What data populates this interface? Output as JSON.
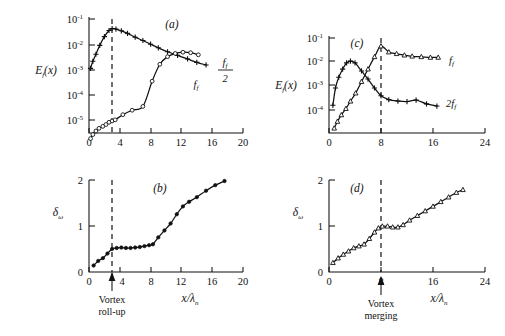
{
  "figure": {
    "panels": [
      {
        "id": "(a)",
        "ylabel": "E_f(x)",
        "y_ticks": [
          {
            "base": "10",
            "exp": "-1"
          },
          {
            "base": "10",
            "exp": "-2"
          },
          {
            "base": "10",
            "exp": "-3"
          },
          {
            "base": "10",
            "exp": "-4"
          },
          {
            "base": "10",
            "exp": "-5"
          }
        ],
        "x_ticks": [
          "0",
          "4",
          "8",
          "12",
          "16",
          "20"
        ],
        "curve_labels": [
          {
            "name": "f_f_over_2",
            "num": "f",
            "numsub": "f",
            "den": "2"
          },
          {
            "name": "f_f",
            "text": "f",
            "sub": "f"
          }
        ],
        "dashed_x": "3"
      },
      {
        "id": "(b)",
        "ylabel": "δ",
        "ylabel_sub": "ω",
        "y_ticks": [
          "0",
          "1",
          "2"
        ],
        "x_ticks": [
          "0",
          "4",
          "8",
          "12",
          "16",
          "20"
        ],
        "xlabel": "x/λ",
        "xlabel_sub": "n",
        "annotation": [
          "Vortex",
          "roll-up"
        ],
        "dashed_x": "3"
      },
      {
        "id": "(c)",
        "ylabel": "E_f(x)",
        "y_ticks": [
          {
            "base": "10",
            "exp": "-1"
          },
          {
            "base": "10",
            "exp": "-2"
          },
          {
            "base": "10",
            "exp": "-3"
          },
          {
            "base": "10",
            "exp": "-4"
          }
        ],
        "x_ticks": [
          "0",
          "8",
          "16",
          "24"
        ],
        "curve_labels": [
          {
            "name": "f_f",
            "text": "f",
            "sub": "f"
          },
          {
            "name": "two_f_f",
            "text": "2f",
            "sub": "f"
          }
        ],
        "dashed_x": "8"
      },
      {
        "id": "(d)",
        "ylabel": "δ",
        "ylabel_sub": "ω",
        "y_ticks": [
          "0",
          "1",
          "2"
        ],
        "x_ticks": [
          "0",
          "8",
          "16",
          "24"
        ],
        "xlabel": "x/λ",
        "xlabel_sub": "n",
        "annotation": [
          "Vortex",
          "merging"
        ],
        "dashed_x": "8"
      }
    ]
  },
  "chart_data": [
    {
      "type": "line",
      "panel": "(a)",
      "title": "(a)",
      "xlabel": "",
      "ylabel": "E_f(x)",
      "yscale": "log",
      "xlim": [
        0,
        20
      ],
      "ylim": [
        3e-06,
        0.1
      ],
      "grid": false,
      "legend": "right-of-curve",
      "vline": 3,
      "series": [
        {
          "name": "f_f/2",
          "marker": "plus",
          "x": [
            0.2,
            0.5,
            0.9,
            1.4,
            2.0,
            2.6,
            3.0,
            3.5,
            4.2,
            5.0,
            6.0,
            7.0,
            8.0,
            9.0,
            10.2,
            11.5,
            12.8,
            14.0,
            15.2
          ],
          "y": [
            0.0011,
            0.0021,
            0.004,
            0.009,
            0.02,
            0.035,
            0.042,
            0.04,
            0.034,
            0.027,
            0.019,
            0.014,
            0.01,
            0.0072,
            0.005,
            0.0036,
            0.0026,
            0.0019,
            0.0015
          ]
        },
        {
          "name": "f_f",
          "marker": "circle",
          "x": [
            0.2,
            0.5,
            0.9,
            1.3,
            1.8,
            2.2,
            2.6,
            3.0,
            3.4,
            4.4,
            5.6,
            7.0,
            8.2,
            9.2,
            10.2,
            11.2,
            12.2,
            13.2,
            14.2
          ],
          "y": [
            1.8e-06,
            2.6e-06,
            3.6e-06,
            4.6e-06,
            5.5e-06,
            6.5e-06,
            8e-06,
            9e-06,
            1e-05,
            1.6e-05,
            2.4e-05,
            3.4e-05,
            0.00034,
            0.0016,
            0.0032,
            0.0043,
            0.0048,
            0.0046,
            0.0038
          ]
        }
      ]
    },
    {
      "type": "line",
      "panel": "(b)",
      "title": "(b)",
      "xlabel": "x/λ_n",
      "ylabel": "δ_ω",
      "yscale": "linear",
      "xlim": [
        0,
        20
      ],
      "ylim": [
        0,
        2.1
      ],
      "grid": false,
      "vline": 3,
      "annotation": "Vortex roll-up",
      "series": [
        {
          "name": "delta_omega",
          "marker": "filled-circle",
          "x": [
            0.6,
            1.2,
            1.8,
            2.4,
            3.0,
            3.6,
            4.2,
            4.8,
            5.4,
            6.0,
            6.6,
            7.2,
            7.8,
            8.3,
            9.0,
            9.8,
            10.6,
            11.4,
            12.2,
            13.0,
            14.0,
            15.2,
            16.4,
            17.6
          ],
          "y": [
            0.14,
            0.24,
            0.3,
            0.4,
            0.5,
            0.52,
            0.53,
            0.52,
            0.52,
            0.53,
            0.54,
            0.56,
            0.58,
            0.6,
            0.75,
            0.9,
            1.05,
            1.25,
            1.42,
            1.52,
            1.62,
            1.76,
            1.88,
            1.97
          ]
        }
      ]
    },
    {
      "type": "line",
      "panel": "(c)",
      "title": "(c)",
      "xlabel": "",
      "ylabel": "E_f(x)",
      "yscale": "log",
      "xlim": [
        0,
        24
      ],
      "ylim": [
        3e-05,
        0.1
      ],
      "grid": false,
      "vline": 8,
      "series": [
        {
          "name": "f_f",
          "marker": "triangle",
          "x": [
            0.8,
            1.3,
            1.9,
            2.6,
            3.3,
            4.1,
            5.0,
            6.0,
            7.0,
            8.0,
            9.2,
            10.4,
            11.6,
            12.8,
            14.2,
            15.6,
            16.8
          ],
          "y": [
            4.5e-05,
            8e-05,
            0.00014,
            0.00024,
            0.00045,
            0.0009,
            0.0024,
            0.007,
            0.02,
            0.05,
            0.03,
            0.026,
            0.023,
            0.021,
            0.02,
            0.019,
            0.019
          ]
        },
        {
          "name": "2f_f",
          "marker": "plus",
          "x": [
            0.6,
            1.0,
            1.5,
            2.1,
            2.7,
            3.3,
            4.0,
            5.0,
            6.0,
            7.0,
            8.0,
            9.2,
            10.6,
            12.0,
            13.4,
            15.0,
            16.6
          ],
          "y": [
            0.00032,
            0.0014,
            0.0035,
            0.007,
            0.012,
            0.014,
            0.012,
            0.006,
            0.003,
            0.0014,
            0.00072,
            0.00052,
            0.00046,
            0.00044,
            0.0005,
            0.00036,
            0.0003
          ]
        }
      ]
    },
    {
      "type": "line",
      "panel": "(d)",
      "title": "(d)",
      "xlabel": "x/λ_n",
      "ylabel": "δ_ω",
      "yscale": "linear",
      "xlim": [
        0,
        24
      ],
      "ylim": [
        0,
        2.1
      ],
      "grid": false,
      "vline": 8,
      "annotation": "Vortex merging",
      "series": [
        {
          "name": "delta_omega",
          "marker": "triangle",
          "x": [
            0.6,
            1.4,
            2.2,
            3.0,
            3.8,
            4.6,
            5.4,
            6.2,
            7.0,
            7.6,
            8.2,
            9.0,
            9.8,
            10.6,
            11.4,
            12.4,
            13.6,
            14.8,
            16.0,
            17.2,
            18.4,
            19.6,
            20.6
          ],
          "y": [
            0.2,
            0.3,
            0.38,
            0.45,
            0.52,
            0.56,
            0.6,
            0.72,
            0.86,
            0.95,
            0.99,
            0.99,
            0.97,
            0.97,
            1.02,
            1.12,
            1.22,
            1.32,
            1.42,
            1.52,
            1.62,
            1.72,
            1.78
          ]
        }
      ]
    }
  ]
}
